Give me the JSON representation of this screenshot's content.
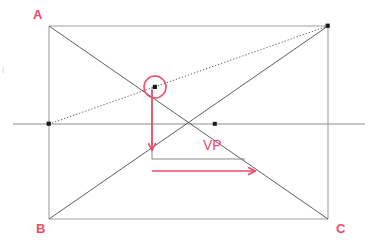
{
  "figure": {
    "type": "perspective-construction-diagram",
    "background_color": "#ffffff"
  },
  "colors": {
    "annotation_red": "#ef4a6b",
    "construction_gray": "#555555",
    "frame_gray": "#9a9a9a",
    "horizon_gray": "#8d8d8d"
  },
  "labels": {
    "corner_a": "A",
    "corner_b": "B",
    "corner_c": "C",
    "vanishing_point": "VP"
  },
  "geometry": {
    "rect": {
      "left": 49,
      "top": 26,
      "right": 328,
      "bottom": 219
    },
    "horizon": {
      "y": 124,
      "x_start": 13,
      "x_end": 365
    },
    "vanishing_point": {
      "x": 215,
      "y": 124
    },
    "left_horizon_dot": {
      "x": 49,
      "y": 124
    },
    "top_right_dot": {
      "x": 328,
      "y": 26
    },
    "circle_marker": {
      "cx": 155,
      "cy": 87,
      "r": 11
    },
    "vertical_arrow": {
      "x": 152,
      "y_start": 90,
      "y_end": 157
    },
    "horizontal_arrow": {
      "y": 171,
      "x_start": 152,
      "x_end": 262
    },
    "guide_vertical": {
      "x": 152,
      "y_start": 87,
      "y_end": 159
    },
    "guide_horizontal": {
      "y": 159,
      "x_start": 152,
      "x_end": 245
    },
    "label_positions": {
      "corner_a": {
        "x": 33,
        "y": 19
      },
      "corner_b": {
        "x": 36,
        "y": 233
      },
      "corner_c": {
        "x": 336,
        "y": 233
      },
      "vanishing_point": {
        "x": 203,
        "y": 150
      }
    }
  }
}
